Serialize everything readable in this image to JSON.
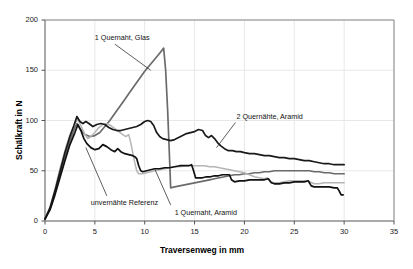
{
  "chart_data": {
    "type": "line",
    "title": "",
    "xlabel": "Traversenweg in mm",
    "ylabel": "Schälkraft in N",
    "xlim": [
      0,
      35
    ],
    "ylim": [
      0,
      200
    ],
    "xticks": [
      0,
      5,
      10,
      15,
      20,
      25,
      30,
      35
    ],
    "yticks": [
      0,
      50,
      100,
      150,
      200
    ],
    "grid": true,
    "legend_position": "inline-annotations",
    "series": [
      {
        "name": "1 Quernaht, Glas",
        "color": "#6b6b6b",
        "label_x": 5.0,
        "label_y": 182,
        "points": [
          [
            0.0,
            2
          ],
          [
            0.5,
            12
          ],
          [
            1.0,
            28
          ],
          [
            1.5,
            46
          ],
          [
            2.0,
            64
          ],
          [
            2.5,
            80
          ],
          [
            3.0,
            93
          ],
          [
            3.2,
            97
          ],
          [
            3.5,
            92
          ],
          [
            4.0,
            86
          ],
          [
            4.5,
            84
          ],
          [
            5.0,
            85
          ],
          [
            5.5,
            88
          ],
          [
            6.0,
            94
          ],
          [
            6.5,
            100
          ],
          [
            7.0,
            107
          ],
          [
            7.5,
            114
          ],
          [
            8.0,
            121
          ],
          [
            8.5,
            128
          ],
          [
            9.0,
            135
          ],
          [
            9.5,
            142
          ],
          [
            10.0,
            149
          ],
          [
            10.5,
            155
          ],
          [
            11.0,
            161
          ],
          [
            11.5,
            167
          ],
          [
            11.9,
            172
          ],
          [
            12.1,
            150
          ],
          [
            12.3,
            110
          ],
          [
            12.5,
            60
          ],
          [
            12.6,
            33
          ],
          [
            13.0,
            34
          ],
          [
            13.5,
            35
          ],
          [
            14.0,
            36
          ],
          [
            14.5,
            37
          ],
          [
            15.0,
            38
          ],
          [
            15.5,
            39
          ],
          [
            16.0,
            40
          ],
          [
            16.5,
            41
          ],
          [
            17.0,
            42
          ],
          [
            17.5,
            43
          ],
          [
            18.0,
            44
          ],
          [
            18.5,
            45
          ],
          [
            19.0,
            46
          ],
          [
            19.5,
            46
          ],
          [
            20.0,
            47
          ],
          [
            20.5,
            47
          ],
          [
            21.0,
            48
          ],
          [
            21.5,
            48
          ],
          [
            22.0,
            49
          ],
          [
            22.5,
            49
          ],
          [
            23.0,
            50
          ],
          [
            23.5,
            50
          ],
          [
            24.0,
            50
          ],
          [
            24.5,
            50
          ],
          [
            25.0,
            50
          ],
          [
            25.5,
            50
          ],
          [
            26.0,
            50
          ],
          [
            26.5,
            50
          ],
          [
            27.0,
            49
          ],
          [
            27.5,
            49
          ],
          [
            28.0,
            48
          ],
          [
            28.5,
            48
          ],
          [
            29.0,
            47
          ],
          [
            29.5,
            47
          ],
          [
            30.0,
            47
          ]
        ]
      },
      {
        "name": "unvernähte Referenz",
        "color": "#b5b5b5",
        "label_x": 4.6,
        "label_y": 18,
        "points": [
          [
            0.0,
            2
          ],
          [
            0.5,
            14
          ],
          [
            1.0,
            32
          ],
          [
            1.5,
            52
          ],
          [
            2.0,
            70
          ],
          [
            2.5,
            86
          ],
          [
            3.0,
            97
          ],
          [
            3.3,
            101
          ],
          [
            3.6,
            95
          ],
          [
            4.0,
            86
          ],
          [
            4.3,
            82
          ],
          [
            4.6,
            84
          ],
          [
            5.0,
            88
          ],
          [
            5.4,
            93
          ],
          [
            5.8,
            96
          ],
          [
            6.2,
            97
          ],
          [
            6.6,
            95
          ],
          [
            7.0,
            92
          ],
          [
            7.4,
            89
          ],
          [
            7.8,
            86
          ],
          [
            8.1,
            84
          ],
          [
            8.4,
            86
          ],
          [
            8.6,
            78
          ],
          [
            8.8,
            68
          ],
          [
            9.0,
            58
          ],
          [
            9.2,
            50
          ],
          [
            9.4,
            47
          ],
          [
            9.8,
            47
          ],
          [
            10.2,
            48
          ],
          [
            10.6,
            49
          ],
          [
            11.0,
            50
          ],
          [
            11.5,
            51
          ],
          [
            12.0,
            52
          ],
          [
            12.5,
            53
          ],
          [
            13.0,
            54
          ],
          [
            13.5,
            54
          ],
          [
            14.0,
            55
          ],
          [
            14.5,
            55
          ],
          [
            15.0,
            55
          ],
          [
            15.5,
            55
          ],
          [
            16.0,
            55
          ],
          [
            16.5,
            54
          ],
          [
            17.0,
            54
          ],
          [
            17.5,
            53
          ],
          [
            18.0,
            52
          ],
          [
            18.5,
            51
          ],
          [
            19.0,
            50
          ],
          [
            19.5,
            49
          ],
          [
            20.0,
            48
          ],
          [
            20.5,
            46
          ],
          [
            21.0,
            44
          ],
          [
            21.5,
            43
          ],
          [
            22.0,
            42
          ],
          [
            22.3,
            43
          ],
          [
            22.6,
            39
          ],
          [
            23.0,
            38
          ],
          [
            23.5,
            38
          ],
          [
            24.0,
            39
          ],
          [
            24.5,
            40
          ],
          [
            25.0,
            40
          ],
          [
            25.5,
            40
          ],
          [
            26.0,
            40
          ],
          [
            26.5,
            39
          ],
          [
            27.0,
            37
          ],
          [
            27.5,
            37
          ],
          [
            28.0,
            38
          ],
          [
            28.5,
            38
          ],
          [
            29.0,
            38
          ],
          [
            29.5,
            38
          ],
          [
            30.0,
            38
          ]
        ]
      },
      {
        "name": "2 Quernähte, Aramid",
        "color": "#1a1a1a",
        "label_x": 19.2,
        "label_y": 103,
        "points": [
          [
            0.0,
            2
          ],
          [
            0.5,
            13
          ],
          [
            1.0,
            30
          ],
          [
            1.5,
            49
          ],
          [
            2.0,
            68
          ],
          [
            2.5,
            84
          ],
          [
            2.9,
            95
          ],
          [
            3.2,
            104
          ],
          [
            3.5,
            99
          ],
          [
            3.8,
            97
          ],
          [
            4.1,
            99
          ],
          [
            4.4,
            97
          ],
          [
            4.8,
            94
          ],
          [
            5.2,
            96
          ],
          [
            5.6,
            97
          ],
          [
            6.0,
            96
          ],
          [
            6.4,
            93
          ],
          [
            6.8,
            91
          ],
          [
            7.2,
            90
          ],
          [
            7.6,
            90
          ],
          [
            8.0,
            91
          ],
          [
            8.4,
            92
          ],
          [
            8.8,
            93
          ],
          [
            9.2,
            94
          ],
          [
            9.6,
            96
          ],
          [
            10.0,
            99
          ],
          [
            10.3,
            100
          ],
          [
            10.6,
            99
          ],
          [
            10.9,
            95
          ],
          [
            11.2,
            88
          ],
          [
            11.5,
            84
          ],
          [
            11.8,
            82
          ],
          [
            12.2,
            81
          ],
          [
            12.6,
            80
          ],
          [
            13.0,
            81
          ],
          [
            13.4,
            83
          ],
          [
            13.8,
            85
          ],
          [
            14.2,
            87
          ],
          [
            14.6,
            88
          ],
          [
            15.0,
            89
          ],
          [
            15.4,
            91
          ],
          [
            15.8,
            90
          ],
          [
            16.1,
            85
          ],
          [
            16.4,
            83
          ],
          [
            16.7,
            85
          ],
          [
            17.0,
            82
          ],
          [
            17.3,
            78
          ],
          [
            17.6,
            75
          ],
          [
            18.0,
            72
          ],
          [
            18.4,
            70
          ],
          [
            18.8,
            70
          ],
          [
            19.2,
            69
          ],
          [
            19.6,
            69
          ],
          [
            20.0,
            68
          ],
          [
            20.5,
            67
          ],
          [
            21.0,
            67
          ],
          [
            21.5,
            66
          ],
          [
            22.0,
            65
          ],
          [
            22.5,
            65
          ],
          [
            23.0,
            64
          ],
          [
            23.5,
            63
          ],
          [
            24.0,
            63
          ],
          [
            24.5,
            62
          ],
          [
            25.0,
            62
          ],
          [
            25.5,
            61
          ],
          [
            26.0,
            60
          ],
          [
            26.5,
            60
          ],
          [
            27.0,
            59
          ],
          [
            27.5,
            58
          ],
          [
            28.0,
            57
          ],
          [
            28.5,
            57
          ],
          [
            29.0,
            56
          ],
          [
            29.5,
            56
          ],
          [
            30.0,
            56
          ]
        ]
      },
      {
        "name": "1 Quernaht, Aramid",
        "color": "#111111",
        "label_x": 13.0,
        "label_y": 8,
        "points": [
          [
            0.0,
            2
          ],
          [
            0.5,
            11
          ],
          [
            1.0,
            26
          ],
          [
            1.5,
            43
          ],
          [
            2.0,
            60
          ],
          [
            2.5,
            76
          ],
          [
            3.0,
            88
          ],
          [
            3.3,
            96
          ],
          [
            3.6,
            90
          ],
          [
            3.9,
            82
          ],
          [
            4.2,
            77
          ],
          [
            4.6,
            73
          ],
          [
            5.0,
            71
          ],
          [
            5.4,
            72
          ],
          [
            5.8,
            76
          ],
          [
            6.2,
            74
          ],
          [
            6.6,
            71
          ],
          [
            7.0,
            69
          ],
          [
            7.3,
            72
          ],
          [
            7.6,
            69
          ],
          [
            8.0,
            67
          ],
          [
            8.4,
            66
          ],
          [
            8.8,
            65
          ],
          [
            9.0,
            64
          ],
          [
            9.2,
            62
          ],
          [
            9.4,
            55
          ],
          [
            9.6,
            50
          ],
          [
            9.8,
            49
          ],
          [
            10.2,
            50
          ],
          [
            10.6,
            51
          ],
          [
            11.0,
            52
          ],
          [
            11.5,
            52
          ],
          [
            12.0,
            53
          ],
          [
            12.5,
            53
          ],
          [
            13.0,
            54
          ],
          [
            13.5,
            55
          ],
          [
            14.0,
            55
          ],
          [
            14.4,
            55
          ],
          [
            14.7,
            56
          ],
          [
            14.9,
            50
          ],
          [
            15.1,
            43
          ],
          [
            15.4,
            43
          ],
          [
            15.8,
            43
          ],
          [
            16.2,
            44
          ],
          [
            16.6,
            44
          ],
          [
            17.0,
            45
          ],
          [
            17.4,
            45
          ],
          [
            17.8,
            46
          ],
          [
            18.2,
            46
          ],
          [
            18.5,
            46
          ],
          [
            18.7,
            41
          ],
          [
            19.0,
            39
          ],
          [
            19.5,
            40
          ],
          [
            20.0,
            40
          ],
          [
            20.5,
            41
          ],
          [
            21.0,
            41
          ],
          [
            21.5,
            41
          ],
          [
            22.0,
            41
          ],
          [
            22.4,
            42
          ],
          [
            22.7,
            38
          ],
          [
            23.0,
            37
          ],
          [
            23.5,
            37
          ],
          [
            24.0,
            38
          ],
          [
            24.5,
            38
          ],
          [
            25.0,
            39
          ],
          [
            25.5,
            39
          ],
          [
            26.0,
            39
          ],
          [
            26.4,
            40
          ],
          [
            26.7,
            35
          ],
          [
            27.0,
            34
          ],
          [
            27.5,
            34
          ],
          [
            28.0,
            34
          ],
          [
            28.5,
            34
          ],
          [
            29.0,
            33
          ],
          [
            29.3,
            33
          ],
          [
            29.5,
            30
          ],
          [
            29.7,
            26
          ],
          [
            29.9,
            26
          ]
        ]
      }
    ],
    "leaders": [
      {
        "name": "leader-glas",
        "x1": 7.0,
        "y1": 176,
        "x2": 10.6,
        "y2": 150
      },
      {
        "name": "leader-referenz",
        "x1": 6.2,
        "y1": 25,
        "x2": 4.1,
        "y2": 73
      },
      {
        "name": "leader-1quernaht-aramid",
        "x1": 12.6,
        "y1": 16,
        "x2": 11.0,
        "y2": 52
      },
      {
        "name": "leader-2quernaehte-aramid",
        "x1": 19.1,
        "y1": 98,
        "x2": 17.2,
        "y2": 73
      }
    ]
  }
}
